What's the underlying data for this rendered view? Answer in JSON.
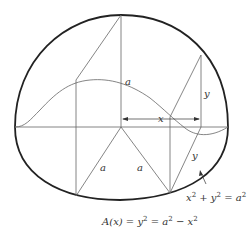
{
  "figure": {
    "labels": {
      "a_vertical": "a",
      "y_right_upper": "y",
      "x_arrow": "x",
      "a_left_slant": "a",
      "a_right_slant": "a",
      "y_right_lower": "y"
    },
    "circle_equation": {
      "x": "x",
      "sup1": "2",
      "plus": " + ",
      "y": "y",
      "sup2": "2",
      "eq": " = ",
      "a": "a",
      "sup3": "2"
    },
    "area_formula": {
      "A": "A",
      "x": "(x)",
      "eq1": " = ",
      "y": "y",
      "sup1": "2",
      "eq2": " = ",
      "a": "a",
      "sup2": "2",
      "minus": " − ",
      "x2": "x",
      "sup3": "2"
    },
    "colors": {
      "outline": "#222222",
      "lines": "#666666",
      "text": "#333333"
    }
  }
}
